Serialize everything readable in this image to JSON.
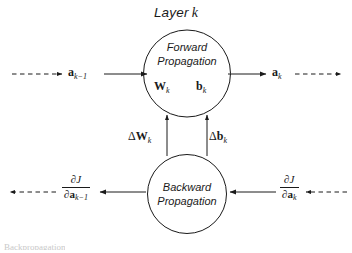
{
  "diagram": {
    "title": "Layer",
    "title_index": "k",
    "forward_node": {
      "line1": "Forward",
      "line2": "Propagation",
      "params": [
        {
          "symbol": "W",
          "subscript": "k"
        },
        {
          "symbol": "b",
          "subscript": "k"
        }
      ]
    },
    "backward_node": {
      "line1": "Backward",
      "line2": "Propagation"
    },
    "signals": {
      "input_activation": {
        "symbol": "a",
        "subscript": "k−1"
      },
      "output_activation": {
        "symbol": "a",
        "subscript": "k"
      }
    },
    "updates": [
      {
        "delta": "Δ",
        "symbol": "W",
        "subscript": "k"
      },
      {
        "delta": "Δ",
        "symbol": "b",
        "subscript": "k"
      }
    ],
    "gradients": {
      "input_gradient": {
        "numerator_partial": "∂",
        "numerator_symbol": "J",
        "denominator_partial": "∂",
        "denominator_symbol": "a",
        "denominator_subscript": "k−1"
      },
      "output_gradient": {
        "numerator_partial": "∂",
        "numerator_symbol": "J",
        "denominator_partial": "∂",
        "denominator_symbol": "a",
        "denominator_subscript": "k"
      }
    },
    "bottom_cut_text": "Backpropagation",
    "colors": {
      "stroke": "#1a1a1a",
      "background": "#ffffff",
      "faint_text": "#c9c9c9"
    }
  }
}
